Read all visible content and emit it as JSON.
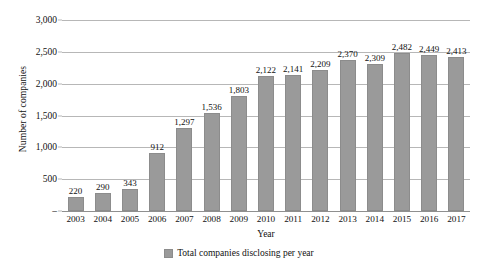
{
  "chart_data": {
    "type": "bar",
    "title": "",
    "xlabel": "Year",
    "ylabel": "Number of companies",
    "categories": [
      "2003",
      "2004",
      "2005",
      "2006",
      "2007",
      "2008",
      "2009",
      "2010",
      "2011",
      "2012",
      "2013",
      "2014",
      "2015",
      "2016",
      "2017"
    ],
    "values": [
      220,
      290,
      343,
      912,
      1297,
      1536,
      1803,
      2122,
      2141,
      2209,
      2370,
      2309,
      2482,
      2449,
      2413
    ],
    "data_labels": [
      "220",
      "290",
      "343",
      "912",
      "1,297",
      "1,536",
      "1,803",
      "2,122",
      "2,141",
      "2,209",
      "2,370",
      "2,309",
      "2,482",
      "2,449",
      "2,413"
    ],
    "ylim": [
      0,
      3000
    ],
    "y_ticks": [
      0,
      500,
      1000,
      1500,
      2000,
      2500,
      3000
    ],
    "y_tick_labels": [
      "–",
      "500",
      "1,000",
      "1,500",
      "2,000",
      "2,500",
      "3,000"
    ],
    "grid": true,
    "legend_position": "bottom",
    "series": [
      {
        "name": "Total companies disclosing per year",
        "color": "#9a9a9a",
        "values": [
          220,
          290,
          343,
          912,
          1297,
          1536,
          1803,
          2122,
          2141,
          2209,
          2370,
          2309,
          2482,
          2449,
          2413
        ]
      }
    ]
  },
  "legend": {
    "items": [
      {
        "label": "Total companies disclosing per year",
        "color": "#9a9a9a"
      }
    ]
  },
  "colors": {
    "bar": "#9a9a9a",
    "gridline": "#b7b7b7",
    "text": "#111111",
    "background": "#ffffff"
  }
}
